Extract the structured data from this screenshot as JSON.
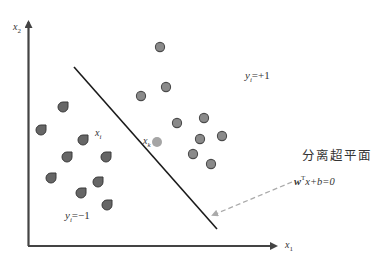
{
  "diagram": {
    "axes": {
      "x_label": "x",
      "x_label_sub": "1",
      "y_label": "x",
      "y_label_sub": "2",
      "color": "#444444"
    },
    "hyperplane": {
      "title": "分离超平面",
      "equation_w": "w",
      "equation_sup": "T",
      "equation_rest": "x+b=0",
      "line_color": "#1a1a1a",
      "pointer_color": "#aaaaaa"
    },
    "class_labels": {
      "positive": {
        "y": "y",
        "sub": "i",
        "value": "=+1"
      },
      "negative": {
        "y": "y",
        "sub": "i",
        "value": "=−1"
      }
    },
    "point_labels": {
      "xi": {
        "x": "x",
        "sub": "i"
      },
      "xk": {
        "x": "x",
        "sub": "k"
      }
    },
    "colors": {
      "positive_fill": "#8a8a8a",
      "positive_stroke": "#4a4a4a",
      "negative_fill": "#666666",
      "negative_stroke": "#3a3a3a",
      "highlight_fill": "#a5a5a5"
    },
    "positive_points": [
      [
        160,
        47
      ],
      [
        166,
        87
      ],
      [
        141,
        96
      ],
      [
        177,
        123
      ],
      [
        204,
        118
      ],
      [
        200,
        139
      ],
      [
        222,
        136
      ],
      [
        193,
        154
      ],
      [
        211,
        164
      ]
    ],
    "negative_points": [
      [
        63,
        107
      ],
      [
        41,
        130
      ],
      [
        83,
        140
      ],
      [
        67,
        157
      ],
      [
        106,
        157
      ],
      [
        51,
        178
      ],
      [
        98,
        182
      ],
      [
        81,
        193
      ],
      [
        107,
        205
      ]
    ],
    "highlight_point": [
      157,
      142
    ]
  }
}
